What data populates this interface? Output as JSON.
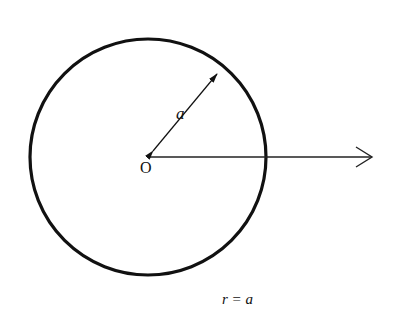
{
  "diagram": {
    "center_label": "O",
    "radius_label": "a",
    "caption": "r = a",
    "colors": {
      "stroke": "#111111",
      "background": "#ffffff"
    },
    "circle": {
      "cx": 148,
      "cy": 157,
      "r": 118
    },
    "radius_line": {
      "from": [
        148,
        157
      ],
      "to": [
        222,
        68
      ]
    },
    "axis_arrow": {
      "from": [
        148,
        157
      ],
      "to": [
        372,
        157
      ]
    }
  }
}
